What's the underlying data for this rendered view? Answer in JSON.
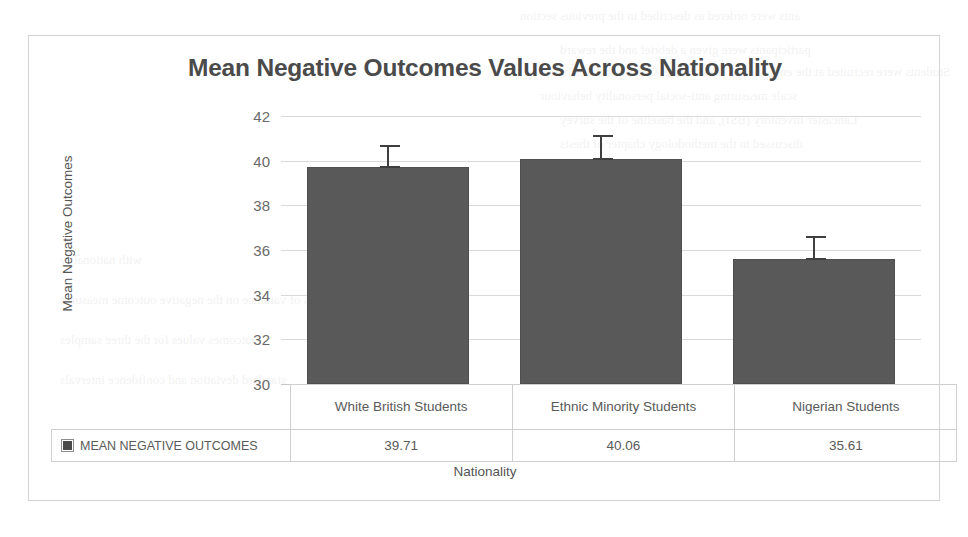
{
  "chart_data": {
    "type": "bar",
    "title": "Mean Negative Outcomes Values Across Nationality",
    "xlabel": "Nationality",
    "ylabel": "Mean Negative Outcomes",
    "categories": [
      "White British Students",
      "Ethnic Minority Students",
      "Nigerian Students"
    ],
    "series": [
      {
        "name": "MEAN NEGATIVE OUTCOMES",
        "values": [
          39.71,
          40.06,
          35.61
        ],
        "value_labels": [
          "39.71",
          "40.06",
          "35.61"
        ],
        "error_upper": [
          0.95,
          1.05,
          0.95
        ],
        "error_lower": [
          0.95,
          1.05,
          0.95
        ],
        "color": "#595959"
      }
    ],
    "ylim": [
      30,
      42
    ],
    "yticks": [
      42,
      40,
      38,
      36,
      34,
      32,
      30
    ],
    "ytick_labels": [
      "42",
      "40",
      "38",
      "36",
      "34",
      "32",
      "30"
    ],
    "grid": true,
    "legend_position": "data-table-row",
    "has_error_bars": true,
    "has_data_table": true
  },
  "legend": {
    "series_label": "MEAN NEGATIVE OUTCOMES",
    "swatch_icon": "square-marker-icon",
    "swatch_color": "#4a4a4a"
  },
  "table": {
    "header_row": [
      "White British Students",
      "Ethnic Minority Students",
      "Nigerian Students"
    ],
    "value_row": [
      "39.71",
      "40.06",
      "35.61"
    ]
  },
  "colors": {
    "bar": "#595959",
    "error_bar": "#3f3f3f",
    "gridline": "#d9d9d9",
    "title_text": "#4a4a4a",
    "axis_text": "#6a6a6a",
    "border": "#d3d3d3"
  },
  "page_bleed": {
    "lines": [
      "ants were ordered as described in the previous section",
      "participants were given a debrief and the reward",
      "Students were recruited at the end, and the stress Score, Coping and Resilience",
      "scale measuring anti-social personality behaviour",
      "Lancaster Inventory (BSI), and the baseline of the survey",
      "discussed in the methodology chapter of thesis",
      "with nationality",
      "the analysis of variance on the negative outcome measures",
      "Outcomes values for the three samples",
      "standard deviation and confidence intervals"
    ]
  }
}
